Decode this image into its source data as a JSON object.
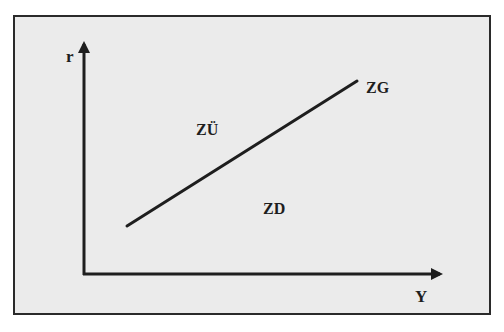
{
  "diagram": {
    "axes": {
      "vertical_label": "r",
      "horizontal_label": "Y"
    },
    "line": {
      "label": "ZG",
      "start": [
        127,
        226
      ],
      "end": [
        357,
        81
      ]
    },
    "regions": {
      "above": "ZÜ",
      "below": "ZD"
    },
    "colors": {
      "background": "#ebebeb",
      "ink": "#1e1e1e"
    }
  }
}
